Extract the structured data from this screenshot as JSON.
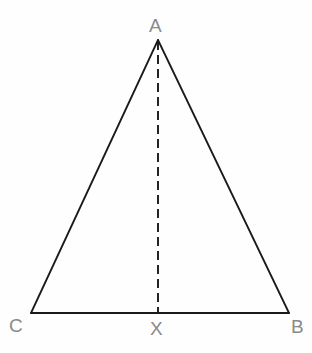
{
  "diagram": {
    "kind": "geometry-figure",
    "canvas": {
      "width": 312,
      "height": 353,
      "background": "#fefefe"
    },
    "style": {
      "stroke_color": "#1a1a1a",
      "stroke_width": 1.8,
      "label_color": "#8a8a8a",
      "label_font_size": 19,
      "dash_pattern": "9 5"
    },
    "points": [
      {
        "id": "A",
        "label": "A",
        "x": 158,
        "y": 40,
        "role": "apex"
      },
      {
        "id": "C",
        "label": "C",
        "x": 31,
        "y": 313,
        "role": "base-left-vertex"
      },
      {
        "id": "B",
        "label": "B",
        "x": 289,
        "y": 313,
        "role": "base-right-vertex"
      },
      {
        "id": "X",
        "label": "X",
        "x": 158,
        "y": 313,
        "role": "foot-of-altitude"
      }
    ],
    "segments": [
      {
        "id": "AC",
        "from": "A",
        "to": "C",
        "style": "solid"
      },
      {
        "id": "AB",
        "from": "A",
        "to": "B",
        "style": "solid"
      },
      {
        "id": "CB",
        "from": "C",
        "to": "B",
        "style": "solid"
      },
      {
        "id": "AX",
        "from": "A",
        "to": "X",
        "style": "dashed"
      }
    ],
    "labels": {
      "apex": "A",
      "base_left": "C",
      "base_right": "B",
      "altitude_foot": "X"
    }
  }
}
